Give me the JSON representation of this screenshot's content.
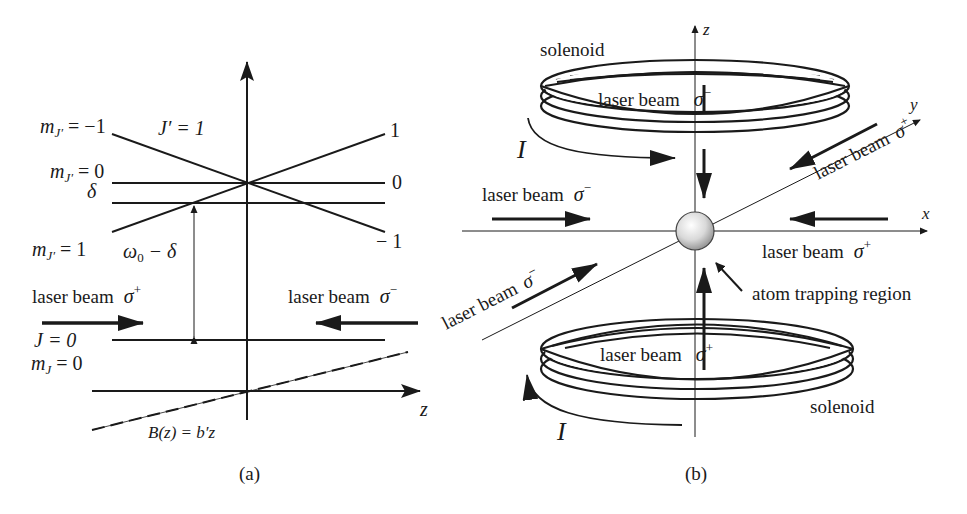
{
  "figure": {
    "panel_a": {
      "caption": "(a)",
      "level_labels": {
        "mJp_minus1": "m",
        "mJp_minus1_sub": "J′",
        "mJp_minus1_rhs": " = −1",
        "Jp": "J′ = 1",
        "mJp_0": "m",
        "mJp_0_sub": "J′",
        "mJp_0_rhs": " = 0",
        "delta": "δ",
        "mJp_1": "m",
        "mJp_1_sub": "J′",
        "mJp_1_rhs": " = 1",
        "omega": "ω",
        "omega_sub": "0",
        "omega_rhs": " − δ",
        "J0": "J = 0",
        "mJ_0": "m",
        "mJ_0_sub": "J",
        "mJ_0_rhs": " = 0"
      },
      "right_labels": {
        "top": "1",
        "mid": "0",
        "bottom": "− 1"
      },
      "beam_left": {
        "label": "laser beam",
        "pol": "σ",
        "pol_sup": "+"
      },
      "beam_right": {
        "label": "laser beam",
        "pol": "σ",
        "pol_sup": "−"
      },
      "axis_label": "z",
      "field_label": "B(z) = b′z"
    },
    "panel_b": {
      "caption": "(b)",
      "axes": {
        "z": "z",
        "x": "x",
        "y": "y"
      },
      "solenoid_top": "solenoid",
      "solenoid_bottom": "solenoid",
      "current_top": "I",
      "current_bottom": "I",
      "beam_top": {
        "label": "laser beam",
        "pol": "σ",
        "pol_sup": "−"
      },
      "beam_left": {
        "label": "laser beam",
        "pol": "σ",
        "pol_sup": "−"
      },
      "beam_right": {
        "label": "laser beam",
        "pol": "σ",
        "pol_sup": "+"
      },
      "beam_diag_upper": {
        "label": "laser beam",
        "pol": "σ",
        "pol_sup": "+"
      },
      "beam_diag_lower": {
        "label": "laser beam",
        "pol": "σ",
        "pol_sup": "−"
      },
      "beam_bottom": {
        "label": "laser beam",
        "pol": "σ",
        "pol_sup": "+"
      },
      "trap_label": "atom trapping region"
    }
  }
}
